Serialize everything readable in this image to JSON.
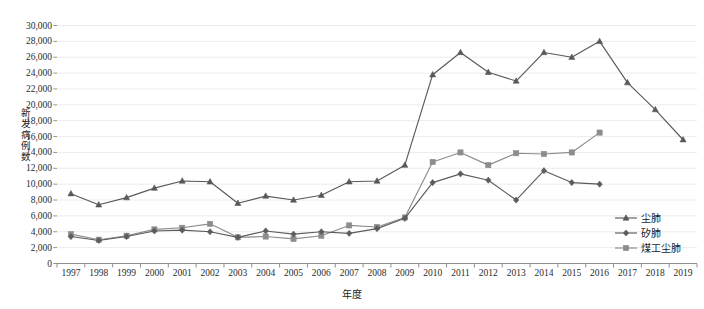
{
  "chart_data": {
    "type": "line",
    "title": "",
    "xlabel": "年度",
    "ylabel": "新发病例数",
    "x": [
      1997,
      1998,
      1999,
      2000,
      2001,
      2002,
      2003,
      2004,
      2005,
      2006,
      2007,
      2008,
      2009,
      2010,
      2011,
      2012,
      2013,
      2014,
      2015,
      2016,
      2017,
      2018,
      2019
    ],
    "xtick_labels": [
      "1997",
      "1998",
      "1999",
      "2000",
      "2001",
      "2002",
      "2003",
      "2004",
      "2005",
      "2006",
      "2007",
      "2008",
      "2009",
      "2010",
      "2011",
      "2012",
      "2013",
      "2014",
      "2015",
      "2016",
      "2017",
      "2018",
      "2019"
    ],
    "ylim": [
      0,
      30000
    ],
    "ytick_values": [
      0,
      2000,
      4000,
      6000,
      8000,
      10000,
      12000,
      14000,
      16000,
      18000,
      20000,
      22000,
      24000,
      26000,
      28000,
      30000
    ],
    "ytick_labels": [
      "0",
      "2,000",
      "4,000",
      "6,000",
      "8,000",
      "10,000",
      "12,000",
      "14,000",
      "16,000",
      "18,000",
      "20,000",
      "22,000",
      "24,000",
      "26,000",
      "28,000",
      "30,000"
    ],
    "grid": true,
    "grid_axis": "y",
    "legend_position": "right-inside",
    "series": [
      {
        "name": "尘肺",
        "color": "#595959",
        "marker": "triangle",
        "values": [
          8800,
          7400,
          8300,
          9500,
          10400,
          10300,
          7600,
          8500,
          8000,
          8600,
          10300,
          10400,
          12400,
          23800,
          26600,
          24100,
          23000,
          26600,
          26000,
          28000,
          22800,
          19400,
          15600
        ]
      },
      {
        "name": "矽肺",
        "color": "#5c5c5c",
        "marker": "diamond",
        "values": [
          3400,
          2900,
          3400,
          4100,
          4200,
          4000,
          3300,
          4100,
          3700,
          4000,
          3800,
          4400,
          5700,
          10200,
          11300,
          10500,
          8000,
          11700,
          10200,
          10000,
          null,
          null,
          null
        ]
      },
      {
        "name": "煤工尘肺",
        "color": "#8c8c8c",
        "marker": "square",
        "values": [
          3700,
          3000,
          3500,
          4300,
          4500,
          5000,
          3300,
          3400,
          3100,
          3500,
          4800,
          4600,
          5800,
          12800,
          14000,
          12400,
          13900,
          13800,
          14000,
          16500,
          null,
          null,
          null
        ]
      }
    ]
  },
  "legend": {
    "items": [
      {
        "label": "尘肺",
        "color": "#595959"
      },
      {
        "label": "矽肺",
        "color": "#5c5c5c"
      },
      {
        "label": "煤工尘肺",
        "color": "#8c8c8c"
      }
    ]
  },
  "axes": {
    "x_title": "年度",
    "y_title_chars": [
      "新",
      "发",
      "病",
      "例",
      "数"
    ]
  }
}
